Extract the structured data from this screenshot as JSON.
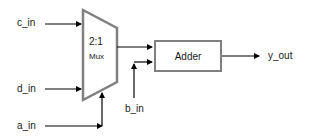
{
  "diagram": {
    "inputs": {
      "c_in": "c_in",
      "d_in": "d_in",
      "a_in": "a_in",
      "b_in": "b_in"
    },
    "output": "y_out",
    "mux": {
      "ratio": "2:1",
      "label": "Mux"
    },
    "adder": {
      "label": "Adder"
    },
    "colors": {
      "block_border": "#808080",
      "wire": "#000000",
      "text": "#1a1a1a"
    }
  }
}
